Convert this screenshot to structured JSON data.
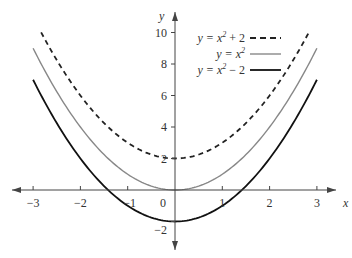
{
  "chart_data": {
    "type": "line",
    "title": "",
    "xlabel": "x",
    "ylabel": "y",
    "xlim": [
      -3.2,
      3.2
    ],
    "ylim": [
      -2.5,
      10.5
    ],
    "x_ticks": [
      -3,
      -2,
      -1,
      0,
      1,
      2,
      3
    ],
    "x_tick_labels": [
      "−3",
      "−2",
      "−1",
      "0",
      "1",
      "2",
      "3"
    ],
    "y_ticks": [
      -2,
      2,
      4,
      6,
      8,
      10
    ],
    "y_tick_labels": [
      "−2",
      "2",
      "4",
      "6",
      "8",
      "10"
    ],
    "grid": false,
    "legend_position": "upper-right",
    "series": [
      {
        "name": "y = x² + 2",
        "style": "dashed",
        "color": "#222222",
        "formula": "x^2 + 2",
        "x_range": [
          -2.83,
          2.83
        ],
        "x": [
          -2.83,
          -2,
          -1,
          0,
          1,
          2,
          2.83
        ],
        "values": [
          10,
          6,
          3,
          2,
          3,
          6,
          10
        ]
      },
      {
        "name": "y = x²",
        "style": "solid",
        "color": "#888888",
        "formula": "x^2",
        "x_range": [
          -3,
          3
        ],
        "x": [
          -3,
          -2,
          -1,
          0,
          1,
          2,
          3
        ],
        "values": [
          9,
          4,
          1,
          0,
          1,
          4,
          9
        ]
      },
      {
        "name": "y = x² − 2",
        "style": "solid",
        "color": "#111111",
        "formula": "x^2 - 2",
        "x_range": [
          -3,
          3
        ],
        "x": [
          -3,
          -2,
          -1,
          0,
          1,
          2,
          3
        ],
        "values": [
          7,
          2,
          -1,
          -2,
          -1,
          2,
          7
        ]
      }
    ]
  },
  "legend": {
    "items": [
      {
        "label_pre": "y = x",
        "sup": "2",
        "label_post": " + 2"
      },
      {
        "label_pre": "y = x",
        "sup": "2",
        "label_post": ""
      },
      {
        "label_pre": "y = x",
        "sup": "2",
        "label_post": " − 2"
      }
    ]
  },
  "axes": {
    "x_name": "x",
    "y_name": "y"
  }
}
